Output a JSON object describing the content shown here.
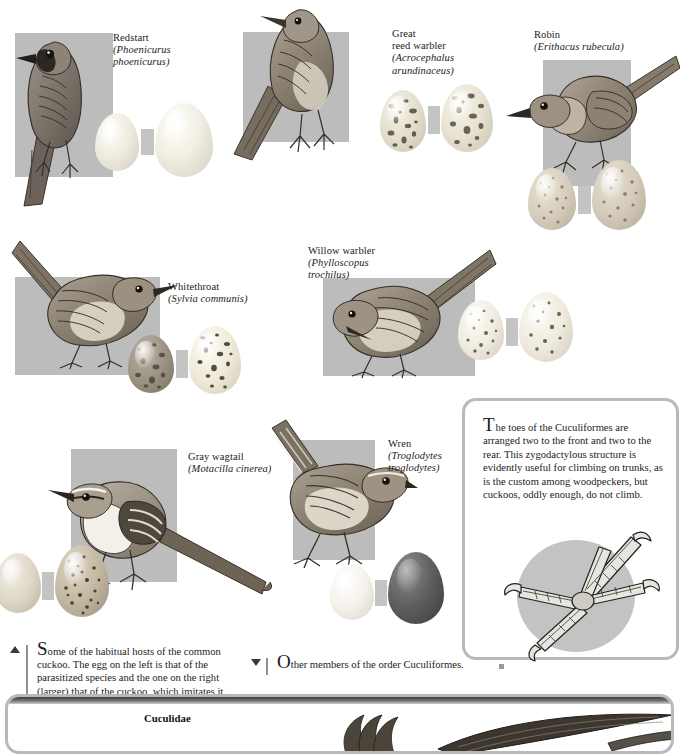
{
  "page": {
    "width": 679,
    "height": 737,
    "background": "#ffffff",
    "plate_color": "#bcbcbc",
    "border_color": "#b9b9b9",
    "text_color": "#1b1b1b"
  },
  "species": [
    {
      "id": "redstart",
      "common_name": "Redstart",
      "scientific_name": "(Phoenicurus phoenicurus)",
      "sci_line1": "(Phoenicurus",
      "sci_line2": "phoenicurus)",
      "host_egg_color": "#efece2",
      "cuckoo_egg_color": "#f2efe4"
    },
    {
      "id": "great-reed-warbler",
      "common_name_line1": "Great",
      "common_name_line2": "reed warbler",
      "common_name": "Great reed warbler",
      "scientific_name": "(Acrocephalus arundinaceus)",
      "sci_line1": "(Acrocephalus",
      "sci_line2": "arundinaceus)",
      "host_egg_color": "#e3ddc9",
      "cuckoo_egg_color": "#e6e0cc"
    },
    {
      "id": "robin",
      "common_name": "Robin",
      "scientific_name": "(Erithacus rubecula)",
      "sci_line1": "(Erithacus rubecula)",
      "host_egg_color": "#d8cfbe",
      "cuckoo_egg_color": "#d5ccba"
    },
    {
      "id": "whitethroat",
      "common_name": "Whitethroat",
      "scientific_name": "(Sylvia communis)",
      "sci_line1": "(Sylvia communis)",
      "host_egg_color": "#9c9384",
      "cuckoo_egg_color": "#efeadb"
    },
    {
      "id": "willow-warbler",
      "common_name": "Willow warbler",
      "scientific_name": "(Phylloscopus trochilus)",
      "sci_line1": "(Phylloscopus",
      "sci_line2": "trochilus)",
      "host_egg_color": "#f0ece0",
      "cuckoo_egg_color": "#efebdf"
    },
    {
      "id": "gray-wagtail",
      "common_name": "Gray wagtail",
      "scientific_name": "(Motacilla cinerea)",
      "sci_line1": "(Motacilla cinerea)",
      "host_egg_color": "#ded7c6",
      "cuckoo_egg_color": "#c3b7a0"
    },
    {
      "id": "wren",
      "common_name": "Wren",
      "scientific_name": "(Troglodytes troglodytes)",
      "sci_line1": "(Troglodytes",
      "sci_line2": "troglodytes)",
      "host_egg_color": "#f4f2ea",
      "cuckoo_egg_color": "#5f5f5f"
    }
  ],
  "info_panel": {
    "text": "The toes of the Cuculiformes are arranged two to the front and two to the rear. This zygodactylous structure is evidently useful for climbing on trunks, as is the custom among woodpeckers, but cuckoos, oddly enough, do not climb.",
    "illustration": "cuckoo-zygodactylous-foot"
  },
  "captions": {
    "left": {
      "marker": "up-triangle",
      "text": "Some of the habitual hosts of the common cuckoo. The egg on the left is that of the parasitized species and the one on the right (larger) that of the cuckoo, which imitates it."
    },
    "right": {
      "marker": "down-triangle",
      "text": "Other members of the order Cuculiformes."
    }
  },
  "bottom_panel": {
    "family": "Cuculidae"
  }
}
